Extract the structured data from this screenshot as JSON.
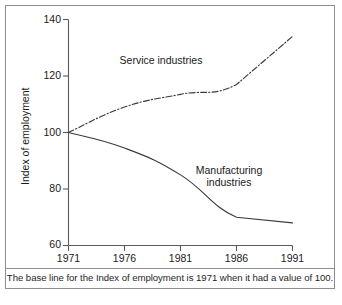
{
  "figure": {
    "caption": "The base line for the Index of employment is 1971 when it had a value of 100.",
    "frame_color": "#8d8d8d",
    "line_color": "#3a3a3a"
  },
  "chart_data": {
    "type": "line",
    "title": "",
    "xlabel": "",
    "ylabel": "Index of employment",
    "x": [
      1971,
      1976,
      1981,
      1986,
      1991
    ],
    "xticklabels": [
      "1971",
      "1976",
      "1981",
      "1986",
      "1991"
    ],
    "yticklabels": [
      "60",
      "80",
      "100",
      "120",
      "140"
    ],
    "yticks": [
      60,
      80,
      100,
      120,
      140
    ],
    "xlim": [
      1971,
      1991
    ],
    "ylim": [
      60,
      140
    ],
    "grid": false,
    "legend": "inline-annotations",
    "series": [
      {
        "name": "Service industries",
        "style": "dash-dot",
        "values": [
          100,
          109,
          113.5,
          117,
          134
        ],
        "label_text": "Service industries"
      },
      {
        "name": "Manufacturing industries",
        "style": "solid",
        "values": [
          100,
          94.5,
          85,
          70,
          68
        ],
        "label_text_line1": "Manufacturing",
        "label_text_line2": "industries"
      }
    ],
    "annotations": [
      {
        "text": "Service industries",
        "x": 1980.5,
        "y": 125
      },
      {
        "text": "Manufacturing",
        "x": 1983.5,
        "y": 86
      },
      {
        "text": "industries",
        "x": 1983.5,
        "y": 81.5
      }
    ]
  }
}
